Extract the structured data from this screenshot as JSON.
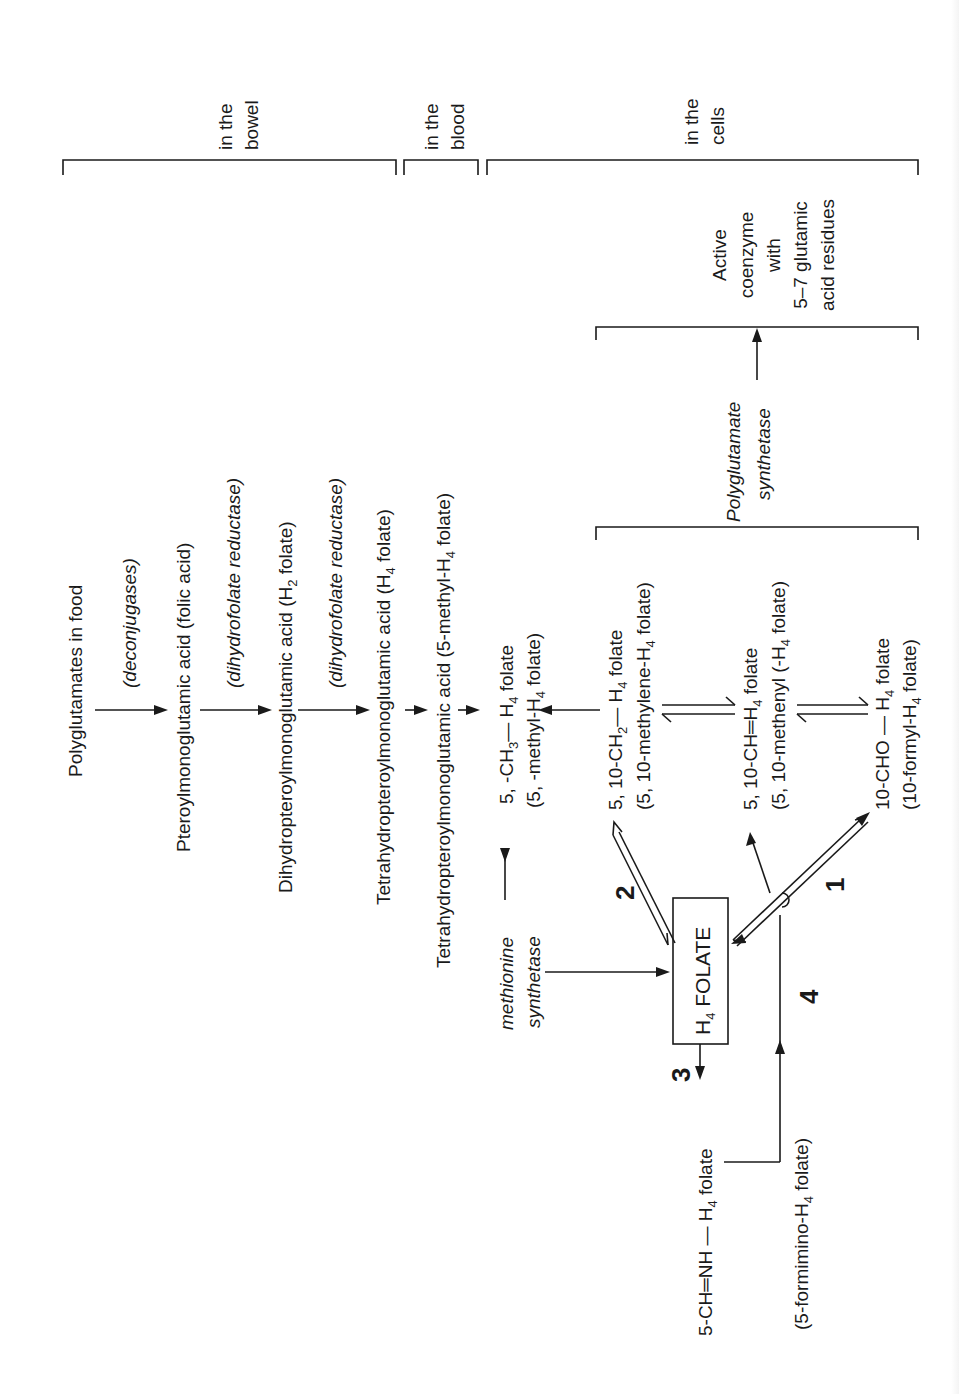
{
  "figure": {
    "orientation": "rotated 90 degrees counter-clockwise"
  },
  "compartments": [
    {
      "id": "bowel",
      "label_line1": "in the",
      "label_line2": "bowel"
    },
    {
      "id": "blood",
      "label_line1": "in the",
      "label_line2": "blood"
    },
    {
      "id": "cells",
      "label_line1": "in the",
      "label_line2": "cells"
    }
  ],
  "absorption_chain": {
    "steps": [
      {
        "compound": "Polyglutamates in food"
      },
      {
        "enzyme": "(deconjugases)"
      },
      {
        "compound": "Pteroylmonoglutamic acid (folic acid)"
      },
      {
        "enzyme": "(dihydrofolate reductase)"
      },
      {
        "compound_main": "Dihydropteroylmonoglutamic acid (H",
        "compound_sub": "2",
        "compound_tail": " folate)"
      },
      {
        "enzyme": "(dihydrofolate reductase)"
      },
      {
        "compound_main": "Tetrahydropteroylmonoglutamic acid (H",
        "compound_sub": "4",
        "compound_tail": " folate)"
      },
      {
        "compound_main": "Tetrahydropteroylmonoglutamic acid (5-methyl-H",
        "compound_sub": "4",
        "compound_tail": " folate)"
      }
    ]
  },
  "cofactors": {
    "methyl": {
      "formula_a": "5, -CH",
      "formula_sub_a": "3",
      "formula_b": "— H",
      "formula_sub_b": "4",
      "formula_c": " folate",
      "name_a": "(5, -methyl-H",
      "name_sub": "4",
      "name_b": " folate)"
    },
    "methylene": {
      "formula_a": "5, 10-CH",
      "formula_sub_a": "2",
      "formula_b": "— H",
      "formula_sub_b": "4",
      "formula_c": " folate",
      "name_a": "(5, 10-methylene-H",
      "name_sub": "4",
      "name_b": " folate)"
    },
    "methenyl": {
      "formula_a": "5, 10-CH═H",
      "formula_sub_b": "4",
      "formula_c": " folate",
      "name_a": "(5, 10-methenyl (-H",
      "name_sub": "4",
      "name_b": " folate)"
    },
    "formyl": {
      "formula_a": "10-CHO — H",
      "formula_sub_b": "4",
      "formula_c": " folate",
      "name_a": "(10-formyl-H",
      "name_sub": "4",
      "name_b": " folate)"
    },
    "formimino": {
      "formula_a": "5-CH═NH — H",
      "formula_sub_b": "4",
      "formula_c": " folate",
      "name_a": "(5-formimino-H",
      "name_sub": "4",
      "name_b": " folate)"
    }
  },
  "central_box": {
    "label_a": "H",
    "label_sub": "4",
    "label_b": " FOLATE"
  },
  "enzymes": {
    "methionine_line1": "methionine",
    "methionine_line2": "synthetase",
    "polyglutamate_line1": "Polyglutamate",
    "polyglutamate_line2": "synthetase"
  },
  "active_coenzyme": {
    "line1": "Active",
    "line2": "coenzyme",
    "line3": "with",
    "line4": "5–7 glutamic",
    "line5": "acid residues"
  },
  "reaction_numbers": [
    "1",
    "2",
    "3",
    "4"
  ],
  "colors": {
    "ink": "#1a1a1a",
    "background": "#ffffff"
  }
}
